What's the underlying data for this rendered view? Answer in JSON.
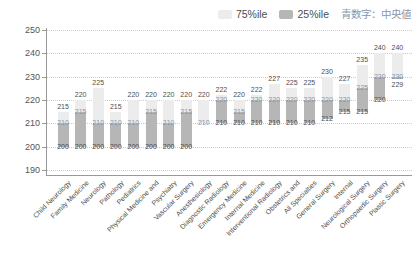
{
  "legend": {
    "p75_label": "75%ile",
    "p25_label": "25%ile",
    "median_note": "青数字：中央値"
  },
  "colors": {
    "p75_fill": "#ececec",
    "p25_fill": "#b6b6b6",
    "median_text": "#8598ab",
    "label_text": "#4d4d4d",
    "grid": "#cccccc",
    "axis": "#999999"
  },
  "chart_data": {
    "type": "bar",
    "subtype": "floating-percentile-range",
    "title": "",
    "xlabel": "",
    "ylabel": "",
    "ylim": [
      190,
      250
    ],
    "yticks": [
      250,
      240,
      230,
      220,
      210,
      200,
      190
    ],
    "grid": true,
    "legend_position": "top-right",
    "categories": [
      "Child Neurology",
      "Family Medicine",
      "Neurology",
      "Pathology",
      "Pediatrics",
      "Physical Medicine and",
      "Psychiatry",
      "Vascular Surgery",
      "Anesthesiology",
      "Diagnostic Radiology",
      "Emergency Medicine",
      "Internal Medicine",
      "Interventional Radiology",
      "Obstetrics and",
      "All Specialties",
      "General Surgery",
      "Internal",
      "Neurological Surgery",
      "Orthopaedic Surgery",
      "Plastic Surgery"
    ],
    "series": [
      {
        "name": "25%ile",
        "values": [
          200,
          200,
          200,
          200,
          200,
          200,
          200,
          200,
          210,
          210,
          210,
          210,
          210,
          210,
          210,
          212,
          215,
          215,
          220,
          229
        ]
      },
      {
        "name": "median",
        "values": [
          210,
          215,
          210,
          210,
          210,
          215,
          210,
          215,
          210,
          220,
          215,
          220,
          220,
          220,
          220,
          220,
          220,
          225,
          230,
          230
        ]
      },
      {
        "name": "75%ile",
        "values": [
          215,
          220,
          225,
          215,
          220,
          220,
          220,
          220,
          220,
          222,
          220,
          222,
          227,
          225,
          225,
          230,
          227,
          235,
          240,
          240
        ]
      }
    ]
  }
}
